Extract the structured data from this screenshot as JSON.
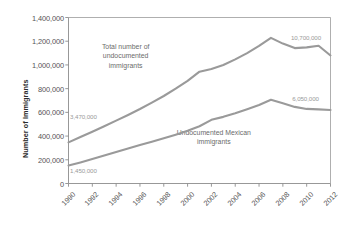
{
  "chart_data": {
    "type": "line",
    "title": "",
    "xlabel": "",
    "ylabel": "Number of Immigrants",
    "x": [
      1990,
      1991,
      1992,
      1993,
      1994,
      1995,
      1996,
      1997,
      1998,
      1999,
      2000,
      2001,
      2002,
      2003,
      2004,
      2005,
      2006,
      2007,
      2008,
      2009,
      2010,
      2011,
      2012
    ],
    "xlim": [
      1990,
      2012
    ],
    "ylim": [
      0,
      1400000
    ],
    "ytick_labels": [
      "1,400,000",
      "1,200,000",
      "1,000,000",
      "800,000",
      "600,000",
      "400,000",
      "200,000",
      "0"
    ],
    "ytick_values": [
      1400000,
      1200000,
      1000000,
      800000,
      600000,
      400000,
      200000,
      0
    ],
    "xtick_labels": [
      "1990",
      "1992",
      "1994",
      "1996",
      "1998",
      "2000",
      "2002",
      "2004",
      "2006",
      "2008",
      "2010",
      "2012"
    ],
    "xtick_values": [
      1990,
      1992,
      1994,
      1996,
      1998,
      2000,
      2002,
      2004,
      2006,
      2008,
      2010,
      2012
    ],
    "grid": false,
    "legend_position": "inline-annotations",
    "series": [
      {
        "name": "Total number of undocumented immigrants",
        "color": "#9a9a9a",
        "values": [
          347000,
          392000,
          437000,
          483000,
          530000,
          578000,
          628000,
          682000,
          738000,
          800000,
          866000,
          943000,
          966000,
          1000000,
          1047000,
          1100000,
          1160000,
          1228000,
          1180000,
          1142000,
          1148000,
          1162000,
          1080000
        ]
      },
      {
        "name": "Undocumented Mexican immigrants",
        "color": "#9a9a9a",
        "values": [
          151000,
          178000,
          206000,
          236000,
          266000,
          295000,
          324000,
          352000,
          381000,
          412000,
          445000,
          483000,
          537000,
          562000,
          592000,
          626000,
          662000,
          706000,
          677000,
          646000,
          629000,
          625000,
          620000
        ]
      }
    ],
    "series_labels": [
      {
        "text": "Total number of undocumented\nimmigrants",
        "x": 1994.8,
        "y": 1150000
      },
      {
        "text": "Undocumented Mexican\nimmigrants",
        "x": 2002.2,
        "y": 430000
      }
    ],
    "annotations": [
      {
        "text": "3,470,000",
        "x": 1990.05,
        "y": 560000
      },
      {
        "text": "1,450,000",
        "x": 1990.05,
        "y": 108000
      },
      {
        "text": "10,700,000",
        "x": 2008.6,
        "y": 1225000
      },
      {
        "text": "6,050,000",
        "x": 2008.7,
        "y": 712000
      }
    ]
  },
  "colors": {
    "line": "#9a9a9a",
    "axis": "#8c8c8c",
    "tick_text": "#555555",
    "annotation_text": "#9a9a9a",
    "axis_title": "#2b2b2b",
    "background": "#ffffff"
  }
}
